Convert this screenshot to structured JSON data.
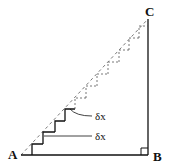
{
  "diagram": {
    "colors": {
      "stroke": "#111111",
      "dashed": "#555555",
      "background": "#ffffff"
    },
    "vertices": {
      "A": {
        "label": "A",
        "x": 21,
        "y": 155,
        "label_x": 8,
        "label_y": 159
      },
      "B": {
        "label": "B",
        "x": 148,
        "y": 155,
        "label_x": 153,
        "label_y": 161
      },
      "C": {
        "label": "C",
        "x": 148,
        "y": 19,
        "label_x": 145,
        "label_y": 16
      }
    },
    "right_angle_marker": {
      "at": "B",
      "size": 7
    },
    "solid_steps": [
      {
        "x": 32,
        "y": 155,
        "w": 11,
        "h": 11
      },
      {
        "x": 43,
        "y": 144,
        "w": 12,
        "h": 12
      },
      {
        "x": 55,
        "y": 132,
        "w": 10,
        "h": 11
      },
      {
        "x": 65,
        "y": 121,
        "w": 10,
        "h": 12
      }
    ],
    "dashed_steps": [
      {
        "x": 75,
        "y": 109,
        "w": 11,
        "h": 11
      },
      {
        "x": 86,
        "y": 98,
        "w": 11,
        "h": 12
      },
      {
        "x": 97,
        "y": 86,
        "w": 11,
        "h": 12
      },
      {
        "x": 108,
        "y": 74,
        "w": 11,
        "h": 12
      },
      {
        "x": 119,
        "y": 62,
        "w": 10,
        "h": 12
      },
      {
        "x": 129,
        "y": 50,
        "w": 10,
        "h": 12
      },
      {
        "x": 139,
        "y": 38,
        "w": 9,
        "h": 12
      }
    ],
    "annotations": [
      {
        "text": "δx",
        "x": 95,
        "y": 120,
        "leader": "M 70 109 Q 76 116 92 116"
      },
      {
        "text": "δx",
        "x": 95,
        "y": 140,
        "leader": "M 44 136 L 92 136"
      }
    ]
  }
}
